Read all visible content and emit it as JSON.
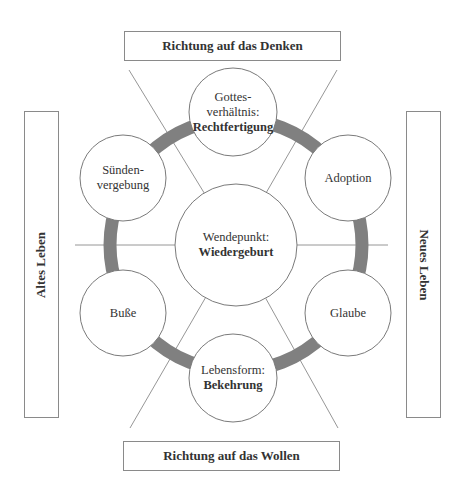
{
  "boxes": {
    "top": "Richtung auf das Denken",
    "bottom": "Richtung auf das Wollen",
    "left": "Altes Leben",
    "right": "Neues Leben"
  },
  "nodes": {
    "top": {
      "line1": "Gottes-",
      "line2": "verhältnis:",
      "bold": "Rechtfertigung"
    },
    "upper_left": {
      "line1": "Sünden-",
      "line2": "vergebung"
    },
    "upper_right": {
      "line1": "Adoption"
    },
    "center": {
      "line1": "Wendepunkt:",
      "bold": "Wiedergeburt"
    },
    "lower_left": {
      "line1": "Buße"
    },
    "lower_right": {
      "line1": "Glaube"
    },
    "bottom": {
      "line1": "Lebensform:",
      "bold": "Bekehrung"
    }
  },
  "colors": {
    "ring": "#808080",
    "lines": "#8a8a8a",
    "circle_stroke": "#7a7a7a"
  }
}
